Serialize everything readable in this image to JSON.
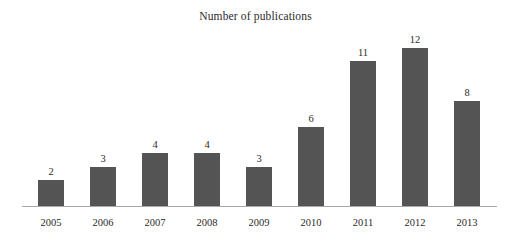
{
  "chart_data": {
    "type": "bar",
    "title": "Number of publications",
    "xlabel": "",
    "ylabel": "",
    "categories": [
      "2005",
      "2006",
      "2007",
      "2008",
      "2009",
      "2010",
      "2011",
      "2012",
      "2013"
    ],
    "values": [
      2,
      3,
      4,
      4,
      3,
      6,
      11,
      12,
      8
    ],
    "value_labels": [
      "2",
      "3",
      "4",
      "4",
      "3",
      "6",
      "11",
      "12",
      "8"
    ],
    "ylim": [
      0,
      12
    ],
    "grid": false,
    "legend": null,
    "bar_color": "#545454",
    "axis_color": "#a8a8a8",
    "background_color": "#ffffff",
    "text_color": "#2b2b2b"
  }
}
